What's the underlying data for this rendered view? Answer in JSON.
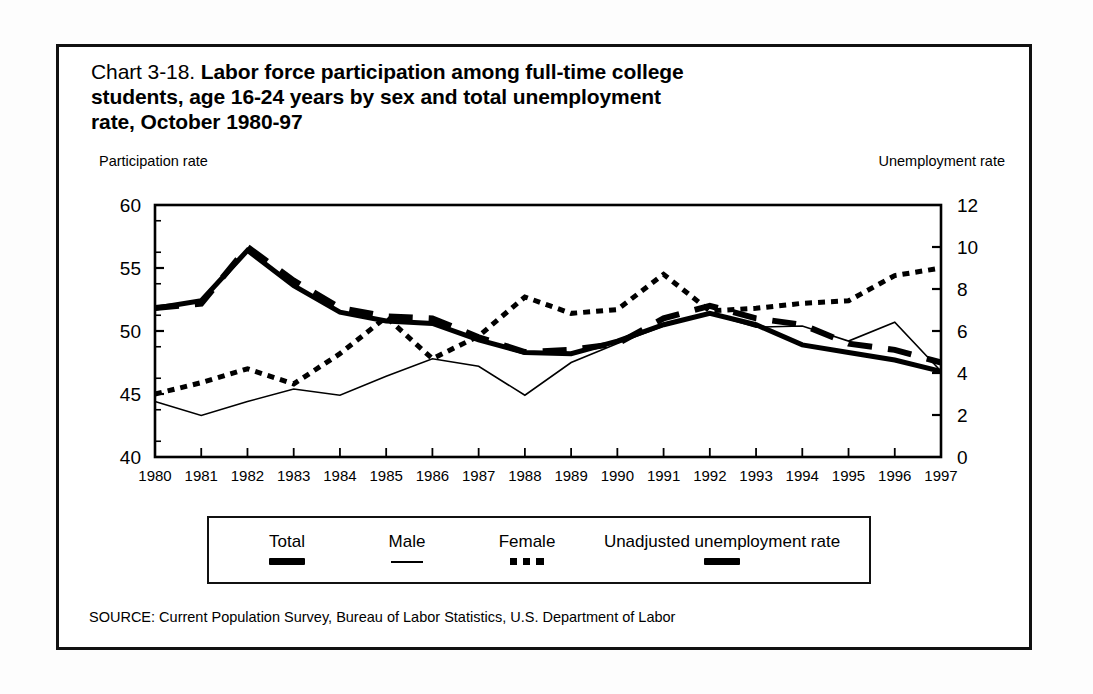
{
  "figure": {
    "chart_number": "Chart 3-18.",
    "title_bold_line1": "Labor force participation among full-time college",
    "title_bold_line2": "students, age 16-24 years by sex and total unemployment",
    "title_bold_line3": "rate, October 1980-97",
    "left_axis_caption": "Participation rate",
    "right_axis_caption": "Unemployment rate",
    "source": "SOURCE: Current Population Survey, Bureau of Labor Statistics, U.S. Department of Labor"
  },
  "legend": {
    "items": [
      {
        "label": "Total",
        "style": "thick-solid"
      },
      {
        "label": "Male",
        "style": "thin-solid"
      },
      {
        "label": "Female",
        "style": "dotted"
      },
      {
        "label": "Unadjusted unemployment rate",
        "style": "thick-dash"
      }
    ]
  },
  "chart_data": {
    "type": "line",
    "title": "Chart 3-18. Labor force participation among full-time college students, age 16-24 years by sex and total unemployment rate, October 1980-97",
    "xlabel": "",
    "ylabel": "Participation rate",
    "y2label": "Unemployment rate",
    "grid": false,
    "legend_position": "bottom",
    "categories": [
      "1980",
      "1981",
      "1982",
      "1983",
      "1984",
      "1985",
      "1986",
      "1987",
      "1988",
      "1989",
      "1990",
      "1991",
      "1992",
      "1993",
      "1994",
      "1995",
      "1996",
      "1997"
    ],
    "xtick_labels": [
      "1980",
      "1981",
      "1982",
      "1983",
      "1984",
      "1985",
      "1986",
      "1987",
      "1988",
      "1989",
      "1990",
      "1991",
      "1992",
      "1993",
      "1994",
      "1995",
      "1996",
      "1997"
    ],
    "ylim": [
      40,
      60
    ],
    "ytick_labels": [
      "40",
      "45",
      "50",
      "55",
      "60"
    ],
    "ytick_values": [
      40,
      45,
      50,
      55,
      60
    ],
    "y2lim": [
      0,
      12
    ],
    "y2tick_labels": [
      "0",
      "2",
      "4",
      "6",
      "8",
      "10",
      "12"
    ],
    "y2tick_values": [
      0,
      2,
      4,
      6,
      8,
      10,
      12
    ],
    "series": [
      {
        "name": "Total",
        "axis": "left",
        "style": "thick-solid",
        "values": [
          51.8,
          52.4,
          56.4,
          53.6,
          51.5,
          50.8,
          50.6,
          49.3,
          48.3,
          48.2,
          49.2,
          50.5,
          51.4,
          50.5,
          48.9,
          48.3,
          47.7,
          46.8
        ]
      },
      {
        "name": "Male",
        "axis": "left",
        "style": "thin-solid",
        "values": [
          44.4,
          43.3,
          44.4,
          45.4,
          44.9,
          46.4,
          47.8,
          47.2,
          44.9,
          47.5,
          49.0,
          50.4,
          51.4,
          50.3,
          50.4,
          49.2,
          50.7,
          46.8
        ]
      },
      {
        "name": "Female",
        "axis": "left",
        "style": "dotted",
        "values": [
          45.0,
          45.9,
          47.0,
          45.8,
          48.2,
          51.1,
          47.8,
          49.6,
          52.7,
          51.4,
          51.7,
          54.5,
          51.6,
          51.8,
          52.2,
          52.4,
          54.4,
          55.0
        ]
      },
      {
        "name": "Unadjusted unemployment rate",
        "axis": "right",
        "style": "thick-dash",
        "values": [
          7.1,
          7.3,
          10.0,
          8.4,
          7.1,
          6.7,
          6.6,
          5.7,
          5.0,
          5.1,
          5.4,
          6.6,
          7.2,
          6.6,
          6.3,
          5.4,
          5.1,
          4.5
        ]
      }
    ]
  }
}
